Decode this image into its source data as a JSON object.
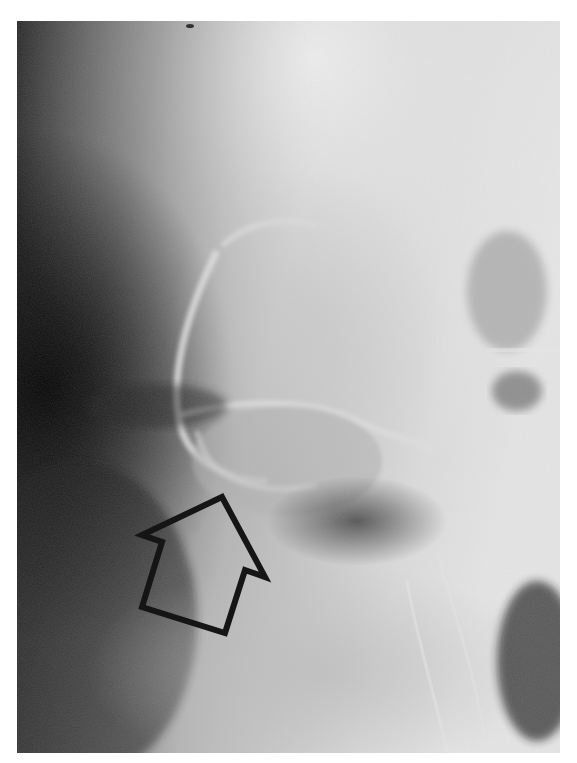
{
  "image": {
    "type": "grayscale radiograph",
    "colors": {
      "background": "#ffffff",
      "film_dark": "#0a0a0a",
      "film_mid": "#8a8a8a",
      "film_light": "#e8e8e8",
      "arrow_stroke": "#151515"
    }
  },
  "annotation": {
    "arrow": {
      "direction": "up-right",
      "style": "hollow outline",
      "icon": "arrow-outline-icon"
    }
  }
}
